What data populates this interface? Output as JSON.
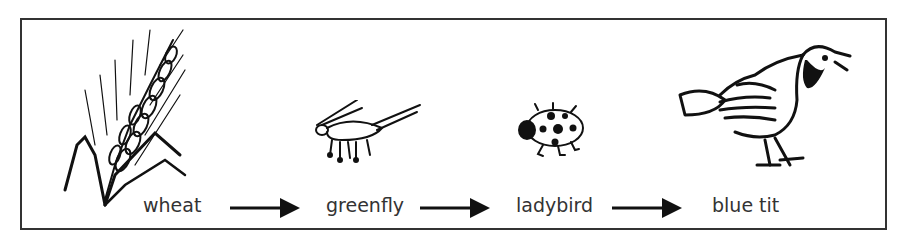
{
  "diagram": {
    "title": "",
    "type": "food_chain",
    "nodes": [
      {
        "id": "wheat",
        "label": "wheat",
        "icon": "wheat-icon"
      },
      {
        "id": "greenfly",
        "label": "greenfly",
        "icon": "greenfly-icon"
      },
      {
        "id": "ladybird",
        "label": "ladybird",
        "icon": "ladybird-icon"
      },
      {
        "id": "blue_tit",
        "label": "blue tit",
        "icon": "blue-tit-icon"
      }
    ],
    "edges": [
      {
        "from": "wheat",
        "to": "greenfly"
      },
      {
        "from": "greenfly",
        "to": "ladybird"
      },
      {
        "from": "ladybird",
        "to": "blue_tit"
      }
    ]
  }
}
